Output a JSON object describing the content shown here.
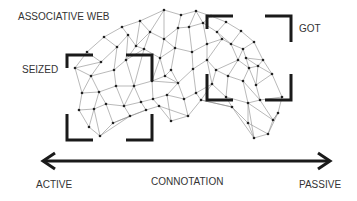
{
  "labels": {
    "title": "ASSOCIATIVE WEB",
    "seized": "SEIZED",
    "got": "GOT",
    "axis_left": "ACTIVE",
    "axis_center": "CONNOTATION",
    "axis_right": "PASSIVE"
  },
  "colors": {
    "edge": "#8a8a8a",
    "node": "#222222",
    "bracket": "#1a1a1a",
    "arrow": "#1a1a1a",
    "text": "#333333"
  },
  "brackets": {
    "seized": {
      "x1": 67,
      "y1": 55,
      "x2": 152,
      "y2": 140
    },
    "got": {
      "x1": 207,
      "y1": 16,
      "x2": 291,
      "y2": 100
    }
  },
  "arrow": {
    "x1": 43,
    "y1": 161,
    "x2": 330,
    "y2": 161
  },
  "nodes": [
    [
      87,
      52
    ],
    [
      104,
      37
    ],
    [
      122,
      27
    ],
    [
      140,
      21
    ],
    [
      164,
      10
    ],
    [
      181,
      15
    ],
    [
      196,
      11
    ],
    [
      211,
      16
    ],
    [
      226,
      22
    ],
    [
      241,
      31
    ],
    [
      254,
      42
    ],
    [
      263,
      60
    ],
    [
      272,
      74
    ],
    [
      282,
      97
    ],
    [
      101,
      62
    ],
    [
      117,
      47
    ],
    [
      128,
      35
    ],
    [
      136,
      46
    ],
    [
      150,
      32
    ],
    [
      164,
      39
    ],
    [
      178,
      28
    ],
    [
      189,
      27
    ],
    [
      203,
      23
    ],
    [
      217,
      32
    ],
    [
      231,
      44
    ],
    [
      243,
      49
    ],
    [
      246,
      58
    ],
    [
      258,
      66
    ],
    [
      75,
      68
    ],
    [
      91,
      76
    ],
    [
      114,
      70
    ],
    [
      126,
      60
    ],
    [
      144,
      49
    ],
    [
      160,
      58
    ],
    [
      175,
      48
    ],
    [
      192,
      52
    ],
    [
      207,
      44
    ],
    [
      222,
      39
    ],
    [
      238,
      60
    ],
    [
      249,
      68
    ],
    [
      256,
      85
    ],
    [
      82,
      93
    ],
    [
      99,
      92
    ],
    [
      116,
      86
    ],
    [
      134,
      86
    ],
    [
      152,
      81
    ],
    [
      165,
      76
    ],
    [
      171,
      70
    ],
    [
      178,
      83
    ],
    [
      193,
      69
    ],
    [
      207,
      60
    ],
    [
      216,
      70
    ],
    [
      228,
      76
    ],
    [
      243,
      81
    ],
    [
      260,
      100
    ],
    [
      79,
      110
    ],
    [
      94,
      109
    ],
    [
      106,
      104
    ],
    [
      124,
      106
    ],
    [
      141,
      102
    ],
    [
      153,
      99
    ],
    [
      167,
      95
    ],
    [
      184,
      99
    ],
    [
      196,
      93
    ],
    [
      212,
      84
    ],
    [
      226,
      97
    ],
    [
      248,
      103
    ],
    [
      273,
      120
    ],
    [
      89,
      127
    ],
    [
      100,
      136
    ],
    [
      113,
      123
    ],
    [
      130,
      116
    ],
    [
      146,
      110
    ],
    [
      159,
      106
    ],
    [
      171,
      121
    ],
    [
      188,
      116
    ],
    [
      201,
      100
    ],
    [
      232,
      107
    ],
    [
      248,
      123
    ],
    [
      268,
      134
    ],
    [
      278,
      113
    ],
    [
      254,
      138
    ]
  ],
  "edges": [
    [
      0,
      1
    ],
    [
      1,
      2
    ],
    [
      2,
      3
    ],
    [
      3,
      4
    ],
    [
      4,
      5
    ],
    [
      5,
      6
    ],
    [
      6,
      7
    ],
    [
      7,
      8
    ],
    [
      8,
      9
    ],
    [
      9,
      10
    ],
    [
      10,
      11
    ],
    [
      11,
      12
    ],
    [
      12,
      13
    ],
    [
      0,
      14
    ],
    [
      1,
      15
    ],
    [
      2,
      16
    ],
    [
      3,
      17
    ],
    [
      3,
      18
    ],
    [
      4,
      18
    ],
    [
      4,
      19
    ],
    [
      5,
      20
    ],
    [
      6,
      21
    ],
    [
      6,
      22
    ],
    [
      7,
      22
    ],
    [
      8,
      23
    ],
    [
      9,
      24
    ],
    [
      10,
      25
    ],
    [
      11,
      26
    ],
    [
      11,
      27
    ],
    [
      12,
      27
    ],
    [
      14,
      15
    ],
    [
      15,
      16
    ],
    [
      16,
      17
    ],
    [
      17,
      18
    ],
    [
      18,
      19
    ],
    [
      19,
      20
    ],
    [
      20,
      21
    ],
    [
      21,
      22
    ],
    [
      22,
      23
    ],
    [
      23,
      24
    ],
    [
      24,
      25
    ],
    [
      25,
      26
    ],
    [
      26,
      27
    ],
    [
      0,
      28
    ],
    [
      14,
      28
    ],
    [
      14,
      29
    ],
    [
      15,
      30
    ],
    [
      16,
      31
    ],
    [
      17,
      31
    ],
    [
      17,
      32
    ],
    [
      18,
      32
    ],
    [
      19,
      33
    ],
    [
      19,
      34
    ],
    [
      20,
      34
    ],
    [
      21,
      35
    ],
    [
      22,
      36
    ],
    [
      23,
      37
    ],
    [
      24,
      38
    ],
    [
      25,
      38
    ],
    [
      26,
      39
    ],
    [
      27,
      39
    ],
    [
      27,
      40
    ],
    [
      12,
      40
    ],
    [
      28,
      29
    ],
    [
      29,
      30
    ],
    [
      30,
      31
    ],
    [
      31,
      32
    ],
    [
      32,
      33
    ],
    [
      33,
      34
    ],
    [
      34,
      35
    ],
    [
      35,
      36
    ],
    [
      36,
      37
    ],
    [
      37,
      24
    ],
    [
      38,
      39
    ],
    [
      39,
      40
    ],
    [
      28,
      41
    ],
    [
      29,
      41
    ],
    [
      29,
      42
    ],
    [
      30,
      43
    ],
    [
      31,
      44
    ],
    [
      32,
      44
    ],
    [
      33,
      45
    ],
    [
      33,
      46
    ],
    [
      34,
      47
    ],
    [
      35,
      49
    ],
    [
      36,
      50
    ],
    [
      37,
      50
    ],
    [
      38,
      51
    ],
    [
      38,
      52
    ],
    [
      39,
      53
    ],
    [
      40,
      54
    ],
    [
      13,
      54
    ],
    [
      41,
      42
    ],
    [
      42,
      43
    ],
    [
      43,
      44
    ],
    [
      44,
      45
    ],
    [
      45,
      46
    ],
    [
      46,
      47
    ],
    [
      47,
      48
    ],
    [
      48,
      49
    ],
    [
      49,
      50
    ],
    [
      50,
      51
    ],
    [
      51,
      52
    ],
    [
      52,
      53
    ],
    [
      53,
      54
    ],
    [
      46,
      48
    ],
    [
      45,
      48
    ],
    [
      41,
      55
    ],
    [
      42,
      56
    ],
    [
      42,
      57
    ],
    [
      43,
      58
    ],
    [
      44,
      58
    ],
    [
      44,
      59
    ],
    [
      45,
      60
    ],
    [
      48,
      61
    ],
    [
      48,
      62
    ],
    [
      49,
      63
    ],
    [
      50,
      64
    ],
    [
      51,
      64
    ],
    [
      52,
      65
    ],
    [
      53,
      66
    ],
    [
      54,
      67
    ],
    [
      54,
      66
    ],
    [
      55,
      56
    ],
    [
      56,
      57
    ],
    [
      57,
      58
    ],
    [
      58,
      59
    ],
    [
      59,
      60
    ],
    [
      60,
      61
    ],
    [
      61,
      62
    ],
    [
      62,
      63
    ],
    [
      63,
      64
    ],
    [
      64,
      65
    ],
    [
      65,
      66
    ],
    [
      66,
      67
    ],
    [
      63,
      76
    ],
    [
      55,
      68
    ],
    [
      56,
      68
    ],
    [
      56,
      69
    ],
    [
      57,
      70
    ],
    [
      58,
      71
    ],
    [
      59,
      72
    ],
    [
      60,
      73
    ],
    [
      61,
      74
    ],
    [
      62,
      75
    ],
    [
      64,
      76
    ],
    [
      65,
      77
    ],
    [
      66,
      78
    ],
    [
      67,
      79
    ],
    [
      67,
      80
    ],
    [
      66,
      81
    ],
    [
      68,
      69
    ],
    [
      69,
      70
    ],
    [
      70,
      71
    ],
    [
      71,
      72
    ],
    [
      72,
      73
    ],
    [
      73,
      74
    ],
    [
      74,
      75
    ],
    [
      75,
      76
    ],
    [
      76,
      77
    ],
    [
      77,
      78
    ],
    [
      78,
      81
    ],
    [
      81,
      79
    ],
    [
      79,
      80
    ],
    [
      80,
      67
    ],
    [
      69,
      71
    ],
    [
      70,
      72
    ],
    [
      73,
      75
    ],
    [
      76,
      77
    ],
    [
      77,
      81
    ],
    [
      78,
      79
    ],
    [
      13,
      80
    ]
  ]
}
